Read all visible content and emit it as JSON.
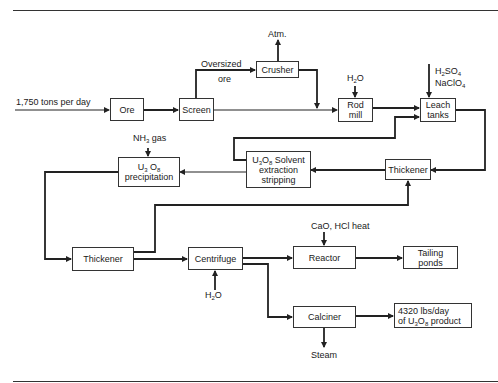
{
  "diagram": {
    "type": "process flow diagram",
    "input": {
      "label": "1,750 tons per day"
    },
    "nodes": [
      {
        "id": "ore",
        "label": "Ore"
      },
      {
        "id": "screen",
        "label": "Screen"
      },
      {
        "id": "crusher",
        "label": "Crusher"
      },
      {
        "id": "rod_mill",
        "label_line1": "Rod",
        "label_line2": "mill"
      },
      {
        "id": "leach_tanks",
        "label_line1": "Leach",
        "label_line2": "tanks"
      },
      {
        "id": "thickener_1",
        "label": "Thickener"
      },
      {
        "id": "solvent",
        "label_line1_prefix": "U",
        "sub1": "3",
        "mid1": "O",
        "sub2": "8",
        "label_line1_suffix": " Solvent",
        "label_line2": "extraction",
        "label_line3": "stripping"
      },
      {
        "id": "precipitation",
        "label_line1_prefix": "U",
        "sub1": "3",
        "mid1": " O",
        "sub2": "8",
        "label_line2": "precipitation"
      },
      {
        "id": "thickener_2",
        "label": "Thickener"
      },
      {
        "id": "centrifuge",
        "label": "Centrifuge"
      },
      {
        "id": "reactor",
        "label": "Reactor"
      },
      {
        "id": "tailing_ponds",
        "label_line1": "Tailing",
        "label_line2": "ponds"
      },
      {
        "id": "calciner",
        "label": "Calciner"
      },
      {
        "id": "product",
        "label_line1": "4320 lbs/day",
        "label_line2_prefix": "of U",
        "sub1": "3",
        "mid1": "O",
        "sub2": "8",
        "label_line2_suffix": " product"
      }
    ],
    "annotations": {
      "oversized_line1": "Oversized",
      "oversized_line2": "ore",
      "atm": "Atm.",
      "h2o_rod": {
        "prefix": "H",
        "sub": "2",
        "suffix": "O"
      },
      "leach_reagent1": {
        "prefix": "H",
        "sub1": "2",
        "mid": "SO",
        "sub2": "4"
      },
      "leach_reagent2": {
        "prefix": "NaClO",
        "sub": "4"
      },
      "nh3": {
        "prefix": "NH",
        "sub": "3",
        "suffix": " gas"
      },
      "reactor_input": "CaO, HCl heat",
      "h2o_centrifuge": {
        "prefix": "H",
        "sub": "2",
        "suffix": "O"
      },
      "steam": "Steam"
    },
    "edges": [
      [
        "input",
        "ore"
      ],
      [
        "ore",
        "screen"
      ],
      [
        "screen",
        "crusher"
      ],
      [
        "crusher",
        "atm"
      ],
      [
        "crusher",
        "rod_mill"
      ],
      [
        "screen",
        "rod_mill"
      ],
      [
        "h2o",
        "rod_mill"
      ],
      [
        "rod_mill",
        "leach_tanks"
      ],
      [
        "reagents",
        "leach_tanks"
      ],
      [
        "solvent",
        "leach_tanks"
      ],
      [
        "leach_tanks",
        "thickener_1"
      ],
      [
        "thickener_1",
        "solvent"
      ],
      [
        "solvent",
        "precipitation"
      ],
      [
        "nh3",
        "precipitation"
      ],
      [
        "precipitation",
        "thickener_2"
      ],
      [
        "thickener_2",
        "thickener_1"
      ],
      [
        "thickener_2",
        "centrifuge"
      ],
      [
        "h2o",
        "centrifuge"
      ],
      [
        "centrifuge",
        "reactor"
      ],
      [
        "reactor_input",
        "reactor"
      ],
      [
        "reactor",
        "tailing_ponds"
      ],
      [
        "centrifuge",
        "calciner"
      ],
      [
        "calciner",
        "product"
      ],
      [
        "calciner",
        "steam"
      ]
    ]
  }
}
